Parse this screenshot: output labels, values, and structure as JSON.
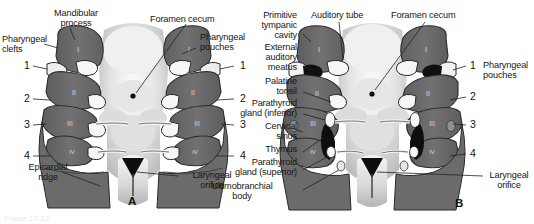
{
  "figure": {
    "background_color": "#ffffff",
    "caption_faint": "Figure 17-12",
    "panels": [
      {
        "id": "A",
        "letter": "A",
        "letter_pos": {
          "x": 128,
          "y": 197
        },
        "labels_left": [
          {
            "name": "mandibular-process",
            "text": "Mandibular\nprocess",
            "x": 36,
            "y": 8,
            "align": "center"
          },
          {
            "name": "pharyngeal-clefts",
            "text": "Pharyngeal\nclefts",
            "x": 2,
            "y": 34,
            "align": "left"
          },
          {
            "name": "epicardial-ridge",
            "text": "Epicardial\nridge",
            "x": 17,
            "y": 162,
            "align": "left"
          }
        ],
        "labels_center": [
          {
            "name": "foramen-cecum",
            "text": "Foramen cecum",
            "x": 150,
            "y": 14,
            "align": "left"
          }
        ],
        "labels_right": [
          {
            "name": "pharyngeal-pouches",
            "text": "Pharyngeal\npouches",
            "x": 200,
            "y": 32,
            "align": "left"
          },
          {
            "name": "laryngeal-orifice",
            "text": "Laryngeal\norifice",
            "x": 180,
            "y": 170,
            "align": "left"
          }
        ],
        "numbers_left": [
          {
            "value": "1",
            "x": 24,
            "y": 62
          },
          {
            "value": "2",
            "x": 24,
            "y": 96
          },
          {
            "value": "3",
            "x": 24,
            "y": 122
          },
          {
            "value": "4",
            "x": 24,
            "y": 152
          }
        ],
        "numbers_right": [
          {
            "value": "1",
            "x": 238,
            "y": 62
          },
          {
            "value": "2",
            "x": 238,
            "y": 96
          },
          {
            "value": "3",
            "x": 238,
            "y": 122
          },
          {
            "value": "4",
            "x": 238,
            "y": 152
          }
        ],
        "arch_numerals": [
          "I",
          "II",
          "III",
          "IV"
        ]
      },
      {
        "id": "B",
        "letter": "B",
        "letter_pos": {
          "x": 188,
          "y": 199
        },
        "labels_left": [
          {
            "name": "primitive-tympanic-cavity",
            "text": "Primitive\ntympanic\ncavity",
            "x": -12,
            "y": 10,
            "align": "right"
          },
          {
            "name": "external-auditory-meatus",
            "text": "External\nauditory\nmeatus",
            "x": -12,
            "y": 44,
            "align": "right"
          },
          {
            "name": "palatine-tonsil",
            "text": "Palatine\ntonsil",
            "x": -12,
            "y": 79,
            "align": "right"
          },
          {
            "name": "parathyroid-gland-inferior",
            "text": "Parathyroid\ngland (inferior)",
            "x": -12,
            "y": 101,
            "align": "right"
          },
          {
            "name": "cervical-sinus",
            "text": "Cervical\nsinus",
            "x": -12,
            "y": 124,
            "align": "right"
          },
          {
            "name": "thymus",
            "text": "Thymus",
            "x": -12,
            "y": 147,
            "align": "right"
          },
          {
            "name": "parathyroid-gland-superior",
            "text": "Parathyroid\ngland (superior)",
            "x": -12,
            "y": 160,
            "align": "right"
          },
          {
            "name": "ultimobranchial-body",
            "text": "Ultimobranchial\nbody",
            "x": -12,
            "y": 183,
            "align": "right"
          }
        ],
        "labels_top": [
          {
            "name": "auditory-tube",
            "text": "Auditory tube",
            "x": 48,
            "y": 10,
            "align": "left"
          },
          {
            "name": "foramen-cecum",
            "text": "Foramen cecum",
            "x": 128,
            "y": 10,
            "align": "left"
          }
        ],
        "labels_right": [
          {
            "name": "pharyngeal-pouches",
            "text": "Pharyngeal\npouches",
            "x": 218,
            "y": 62,
            "align": "left"
          },
          {
            "name": "laryngeal-orifice",
            "text": "Laryngeal\norifice",
            "x": 219,
            "y": 170,
            "align": "left"
          }
        ],
        "numbers_right": [
          {
            "value": "1",
            "x": 203,
            "y": 62
          },
          {
            "value": "2",
            "x": 203,
            "y": 93
          },
          {
            "value": "3",
            "x": 203,
            "y": 121
          },
          {
            "value": "4",
            "x": 203,
            "y": 150
          }
        ],
        "arch_numerals": [
          "I",
          "II",
          "III",
          "IV"
        ]
      }
    ]
  },
  "colors": {
    "arch_fill": "#6e6e6e",
    "arch_fill_dark": "#5a5a5a",
    "arch_outline": "#2b2b2b",
    "midline_light": "#e7e7e7",
    "midline_mid": "#cfcfcf",
    "thymus_dark": "#111111",
    "pouch_white": "#f4f4f4",
    "leader_line": "#222222",
    "background": "#ffffff"
  }
}
